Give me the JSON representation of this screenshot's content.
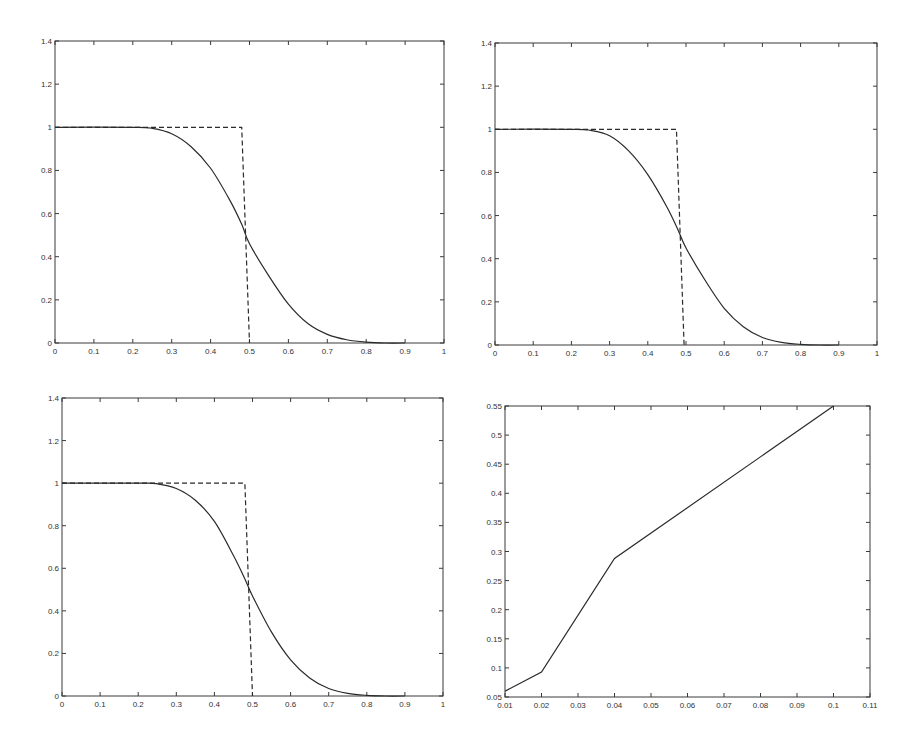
{
  "chart_data": [
    {
      "id": "top-left",
      "type": "line",
      "title": "",
      "xlabel": "",
      "ylabel": "",
      "xlim": [
        0,
        1
      ],
      "ylim": [
        0,
        1.4
      ],
      "xticks": [
        0,
        0.1,
        0.2,
        0.3,
        0.4,
        0.5,
        0.6,
        0.7,
        0.8,
        0.9,
        1
      ],
      "xtick_labels": [
        "0",
        "0.1",
        "0.2",
        "0.3",
        "0.4",
        "0.5",
        "0.6",
        "0.7",
        "0.8",
        "0.9",
        "1"
      ],
      "yticks": [
        0,
        0.2,
        0.4,
        0.6,
        0.8,
        1,
        1.2,
        1.4
      ],
      "ytick_labels": [
        "0",
        "0.2",
        "0.4",
        "0.6",
        "0.8",
        "1",
        "1.2",
        "1.4"
      ],
      "grid": false,
      "legend": null,
      "frame": {
        "x0": 55,
        "y0": 41,
        "x1": 444,
        "y1": 343
      },
      "series": [
        {
          "name": "step (dashed)",
          "style": "dashed",
          "x": [
            0,
            0.48,
            0.48,
            0.5,
            0.5
          ],
          "y": [
            1,
            1,
            1,
            0.0,
            0.0
          ]
        },
        {
          "name": "smooth (solid)",
          "style": "solid",
          "x": [
            0,
            0.2,
            0.25,
            0.3,
            0.35,
            0.4,
            0.45,
            0.48,
            0.5,
            0.55,
            0.6,
            0.65,
            0.7,
            0.75,
            0.8,
            0.85,
            0.9
          ],
          "y": [
            1,
            1,
            0.995,
            0.97,
            0.91,
            0.81,
            0.66,
            0.55,
            0.46,
            0.31,
            0.18,
            0.09,
            0.04,
            0.015,
            0.004,
            0.0,
            0.0
          ]
        }
      ]
    },
    {
      "id": "top-right",
      "type": "line",
      "title": "",
      "xlabel": "",
      "ylabel": "",
      "xlim": [
        0,
        1
      ],
      "ylim": [
        0,
        1.4
      ],
      "xticks": [
        0,
        0.1,
        0.2,
        0.3,
        0.4,
        0.5,
        0.6,
        0.7,
        0.8,
        0.9,
        1
      ],
      "xtick_labels": [
        "0",
        "0.1",
        "0.2",
        "0.3",
        "0.4",
        "0.5",
        "0.6",
        "0.7",
        "0.8",
        "0.9",
        "1"
      ],
      "yticks": [
        0,
        0.2,
        0.4,
        0.6,
        0.8,
        1,
        1.2,
        1.4
      ],
      "ytick_labels": [
        "0",
        "0.2",
        "0.4",
        "0.6",
        "0.8",
        "1",
        "1.2",
        "1.4"
      ],
      "grid": false,
      "legend": null,
      "frame": {
        "x0": 495,
        "y0": 43,
        "x1": 877,
        "y1": 345
      },
      "series": [
        {
          "name": "step (dashed)",
          "style": "dashed",
          "x": [
            0,
            0.475,
            0.475,
            0.495,
            0.495
          ],
          "y": [
            1,
            1,
            1,
            0.0,
            0.0
          ]
        },
        {
          "name": "smooth (solid)",
          "style": "solid",
          "x": [
            0,
            0.2,
            0.25,
            0.3,
            0.35,
            0.4,
            0.45,
            0.48,
            0.5,
            0.55,
            0.6,
            0.65,
            0.7,
            0.75,
            0.8,
            0.85,
            0.9
          ],
          "y": [
            1,
            1,
            0.995,
            0.97,
            0.9,
            0.79,
            0.64,
            0.53,
            0.45,
            0.3,
            0.17,
            0.085,
            0.035,
            0.012,
            0.003,
            0.0,
            0.0
          ]
        }
      ]
    },
    {
      "id": "bottom-left",
      "type": "line",
      "title": "",
      "xlabel": "",
      "ylabel": "",
      "xlim": [
        0,
        1
      ],
      "ylim": [
        0,
        1.4
      ],
      "xticks": [
        0,
        0.1,
        0.2,
        0.3,
        0.4,
        0.5,
        0.6,
        0.7,
        0.8,
        0.9,
        1
      ],
      "xtick_labels": [
        "0",
        "0.1",
        "0.2",
        "0.3",
        "0.4",
        "0.5",
        "0.6",
        "0.7",
        "0.8",
        "0.9",
        "1"
      ],
      "yticks": [
        0,
        0.2,
        0.4,
        0.6,
        0.8,
        1,
        1.2,
        1.4
      ],
      "ytick_labels": [
        "0",
        "0.2",
        "0.4",
        "0.6",
        "0.8",
        "1",
        "1.2",
        "1.4"
      ],
      "grid": false,
      "legend": null,
      "frame": {
        "x0": 62,
        "y0": 398,
        "x1": 443,
        "y1": 696
      },
      "series": [
        {
          "name": "step (dashed)",
          "style": "dashed",
          "x": [
            0,
            0.48,
            0.48,
            0.5,
            0.5
          ],
          "y": [
            1,
            1,
            1,
            0.0,
            0.0
          ]
        },
        {
          "name": "smooth (solid)",
          "style": "solid",
          "x": [
            0,
            0.2,
            0.25,
            0.3,
            0.35,
            0.4,
            0.45,
            0.48,
            0.5,
            0.55,
            0.6,
            0.65,
            0.7,
            0.75,
            0.8,
            0.85,
            0.9
          ],
          "y": [
            1,
            1,
            0.997,
            0.975,
            0.92,
            0.82,
            0.66,
            0.55,
            0.47,
            0.3,
            0.17,
            0.085,
            0.035,
            0.012,
            0.003,
            0.0,
            0.0
          ]
        }
      ]
    },
    {
      "id": "bottom-right",
      "type": "line",
      "title": "",
      "xlabel": "",
      "ylabel": "",
      "xlim": [
        0.01,
        0.11
      ],
      "ylim": [
        0.05,
        0.55
      ],
      "xticks": [
        0.01,
        0.02,
        0.03,
        0.04,
        0.05,
        0.06,
        0.07,
        0.08,
        0.09,
        0.1,
        0.11
      ],
      "xtick_labels": [
        "0.01",
        "0.02",
        "0.03",
        "0.04",
        "0.05",
        "0.06",
        "0.07",
        "0.08",
        "0.09",
        "0.1",
        "0.11"
      ],
      "yticks": [
        0.05,
        0.1,
        0.15,
        0.2,
        0.25,
        0.3,
        0.35,
        0.4,
        0.45,
        0.5,
        0.55
      ],
      "ytick_labels": [
        "0.05",
        "0.1",
        "0.15",
        "0.2",
        "0.25",
        "0.3",
        "0.35",
        "0.4",
        "0.45",
        "0.5",
        "0.55"
      ],
      "grid": false,
      "legend": null,
      "frame": {
        "x0": 505,
        "y0": 406,
        "x1": 870,
        "y1": 697
      },
      "series": [
        {
          "name": "series 1",
          "style": "solid",
          "x": [
            0.01,
            0.02,
            0.04,
            0.1
          ],
          "y": [
            0.06,
            0.093,
            0.288,
            0.55
          ]
        }
      ]
    }
  ],
  "colors": {
    "background": "#ffffff",
    "axes": "#3a3a3a",
    "line": "#2a2a2a",
    "text": "#333333"
  }
}
